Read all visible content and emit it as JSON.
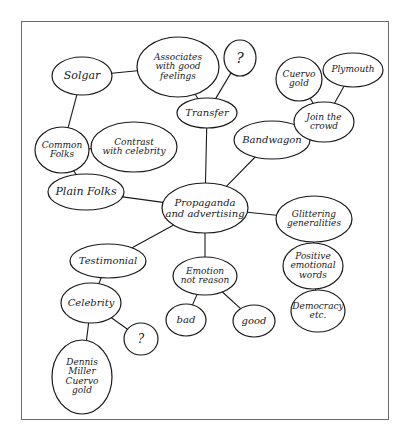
{
  "diagram": {
    "type": "concept-map",
    "central_node": "propaganda",
    "nodes": [
      {
        "id": "propaganda",
        "label": "Propaganda\nand advertising",
        "cx": 205,
        "cy": 208,
        "rx": 43,
        "ry": 25,
        "fs": 10
      },
      {
        "id": "transfer",
        "label": "Transfer",
        "cx": 207,
        "cy": 113,
        "rx": 30,
        "ry": 15,
        "fs": 10
      },
      {
        "id": "question1",
        "label": "?",
        "cx": 240,
        "cy": 58,
        "rx": 16,
        "ry": 18,
        "fs": 14
      },
      {
        "id": "associates",
        "label": "Associates\nwith good\nfeelings",
        "cx": 178,
        "cy": 67,
        "rx": 41,
        "ry": 30,
        "fs": 9
      },
      {
        "id": "solgar",
        "label": "Solgar",
        "cx": 82,
        "cy": 76,
        "rx": 30,
        "ry": 19,
        "fs": 11
      },
      {
        "id": "common-folks",
        "label": "Common\nFolks",
        "cx": 62,
        "cy": 150,
        "rx": 27,
        "ry": 23,
        "fs": 9
      },
      {
        "id": "contrast",
        "label": "Contrast\nwith celebrity",
        "cx": 134,
        "cy": 147,
        "rx": 43,
        "ry": 25,
        "fs": 9
      },
      {
        "id": "plain-folks",
        "label": "Plain Folks",
        "cx": 86,
        "cy": 192,
        "rx": 38,
        "ry": 18,
        "fs": 11
      },
      {
        "id": "bandwagon",
        "label": "Bandwagon",
        "cx": 272,
        "cy": 140,
        "rx": 38,
        "ry": 19,
        "fs": 10
      },
      {
        "id": "join-crowd",
        "label": "Join the\ncrowd",
        "cx": 324,
        "cy": 122,
        "rx": 30,
        "ry": 20,
        "fs": 9
      },
      {
        "id": "cuervo-gold-top",
        "label": "Cuervo\ngold",
        "cx": 299,
        "cy": 79,
        "rx": 23,
        "ry": 22,
        "fs": 9
      },
      {
        "id": "plymouth",
        "label": "Plymouth",
        "cx": 353,
        "cy": 70,
        "rx": 30,
        "ry": 17,
        "fs": 9
      },
      {
        "id": "glittering",
        "label": "Glittering\ngeneralities",
        "cx": 314,
        "cy": 219,
        "rx": 38,
        "ry": 23,
        "fs": 9
      },
      {
        "id": "positive-words",
        "label": "Positive\nemotional\nwords",
        "cx": 313,
        "cy": 266,
        "rx": 30,
        "ry": 23,
        "fs": 9
      },
      {
        "id": "democracy",
        "label": "Democracy\netc.",
        "cx": 318,
        "cy": 311,
        "rx": 27,
        "ry": 21,
        "fs": 9
      },
      {
        "id": "emotion",
        "label": "Emotion\nnot reason",
        "cx": 205,
        "cy": 276,
        "rx": 32,
        "ry": 19,
        "fs": 9
      },
      {
        "id": "bad",
        "label": "bad",
        "cx": 186,
        "cy": 320,
        "rx": 20,
        "ry": 16,
        "fs": 10
      },
      {
        "id": "good",
        "label": "good",
        "cx": 254,
        "cy": 321,
        "rx": 21,
        "ry": 16,
        "fs": 10
      },
      {
        "id": "testimonial",
        "label": "Testimonial",
        "cx": 108,
        "cy": 261,
        "rx": 38,
        "ry": 17,
        "fs": 10
      },
      {
        "id": "celebrity",
        "label": "Celebrity",
        "cx": 91,
        "cy": 303,
        "rx": 30,
        "ry": 20,
        "fs": 10
      },
      {
        "id": "question2",
        "label": "?",
        "cx": 141,
        "cy": 339,
        "rx": 17,
        "ry": 16,
        "fs": 12
      },
      {
        "id": "dennis",
        "label": "Dennis\nMiller\nCuervo\ngold",
        "cx": 82,
        "cy": 377,
        "rx": 30,
        "ry": 37,
        "fs": 9
      }
    ],
    "edges": [
      {
        "from": "propaganda",
        "to": "transfer",
        "points": [
          207,
          183,
          207,
          128
        ]
      },
      {
        "from": "transfer",
        "to": "question1",
        "points": [
          222,
          99,
          236,
          76
        ]
      },
      {
        "from": "transfer",
        "to": "associates",
        "points": [
          194,
          99,
          190,
          93
        ]
      },
      {
        "from": "associates",
        "to": "solgar",
        "points": [
          138,
          72,
          112,
          70
        ]
      },
      {
        "from": "solgar",
        "to": "common-folks",
        "points": [
          80,
          95,
          71,
          128
        ]
      },
      {
        "from": "common-folks",
        "to": "contrast",
        "points": [
          89,
          152,
          92,
          152
        ]
      },
      {
        "from": "common-folks",
        "to": "plain-folks",
        "points": [
          73,
          173,
          75,
          176
        ]
      },
      {
        "from": "plain-folks",
        "to": "propaganda",
        "points": [
          120,
          199,
          163,
          203
        ]
      },
      {
        "from": "propaganda",
        "to": "bandwagon",
        "points": [
          232,
          188,
          257,
          158
        ]
      },
      {
        "from": "bandwagon",
        "to": "join-crowd",
        "points": [
          309,
          136,
          296,
          131
        ]
      },
      {
        "from": "join-crowd",
        "to": "cuervo-gold-top",
        "points": [
          308,
          104,
          307,
          99
        ]
      },
      {
        "from": "join-crowd",
        "to": "plymouth",
        "points": [
          348,
          101,
          350,
          87
        ]
      },
      {
        "from": "propaganda",
        "to": "glittering",
        "points": [
          248,
          212,
          276,
          212
        ]
      },
      {
        "from": "glittering",
        "to": "positive-words",
        "points": [
          314,
          242,
          314,
          243
        ]
      },
      {
        "from": "positive-words",
        "to": "democracy",
        "points": [
          314,
          289,
          316,
          290
        ]
      },
      {
        "from": "propaganda",
        "to": "emotion",
        "points": [
          205,
          233,
          205,
          257
        ]
      },
      {
        "from": "emotion",
        "to": "bad",
        "points": [
          220,
          293,
          204,
          312
        ]
      },
      {
        "from": "emotion",
        "to": "good",
        "points": [
          220,
          293,
          240,
          310
        ]
      },
      {
        "from": "propaganda",
        "to": "testimonial",
        "points": [
          168,
          224,
          145,
          245
        ]
      },
      {
        "from": "testimonial",
        "to": "celebrity",
        "points": [
          99,
          278,
          95,
          283
        ]
      },
      {
        "from": "celebrity",
        "to": "question2",
        "points": [
          112,
          318,
          127,
          330
        ]
      },
      {
        "from": "celebrity",
        "to": "dennis",
        "points": [
          88,
          323,
          83,
          340
        ]
      }
    ]
  },
  "style": {
    "stroke": "#1a1a1a",
    "frame": "#6a6a6a",
    "background": "#ffffff"
  }
}
